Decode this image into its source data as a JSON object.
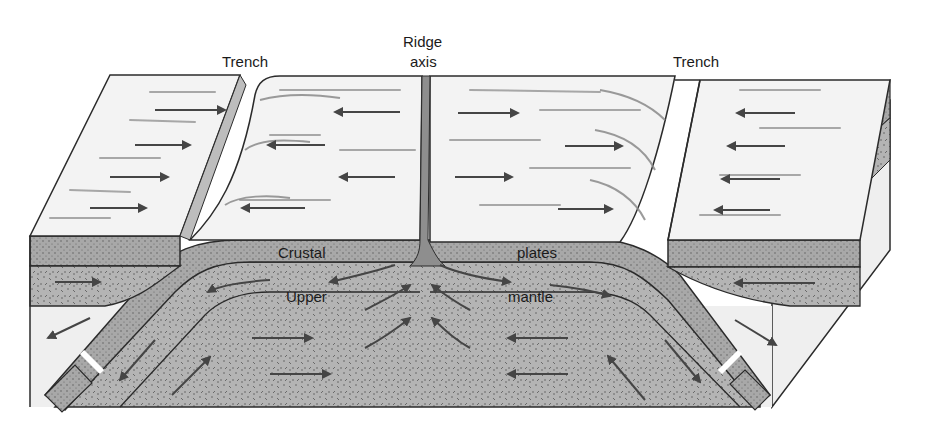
{
  "diagram": {
    "labels": {
      "trench_left": "Trench",
      "ridge_line1": "Ridge",
      "ridge_line2": "axis",
      "trench_right": "Trench",
      "crustal": "Crustal",
      "plates": "plates",
      "upper": "Upper",
      "mantle": "mantle"
    },
    "layers": [
      {
        "name": "ocean-floor-surface",
        "fill": "#f2f2f2"
      },
      {
        "name": "crustal-plate",
        "fill": "#a9a9a9"
      },
      {
        "name": "upper-mantle",
        "fill": "#b3b3b3"
      },
      {
        "name": "block-side",
        "fill": "#efefef"
      }
    ],
    "colors": {
      "outline": "#2b2b2b",
      "arrow": "#4a4a4a",
      "streak": "#9a9a9a",
      "ridge": "#8a8a8a"
    }
  }
}
